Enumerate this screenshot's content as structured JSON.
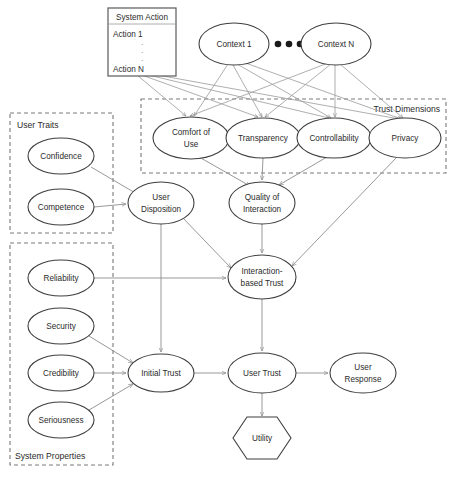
{
  "diagram": {
    "colors": {
      "node_stroke": "#3f3f3f",
      "edge": "#8c8c8c",
      "group_stroke": "#7a7a7a",
      "text": "#2b2b2b",
      "background": "#ffffff"
    },
    "system_action_table": {
      "header": "System Action",
      "rows": [
        "Action 1",
        "Action N"
      ],
      "ellipsis": "·"
    },
    "context_nodes": [
      {
        "id": "context1",
        "label": "Context 1",
        "cx": 234,
        "cy": 44,
        "rx": 35,
        "ry": 21
      },
      {
        "id": "contextN",
        "label": "Context N",
        "cx": 336,
        "cy": 44,
        "rx": 35,
        "ry": 21
      }
    ],
    "context_ellipsis_dots": 3,
    "groups": [
      {
        "id": "trust-dimensions",
        "label": "Trust Dimensions",
        "x": 141,
        "y": 99,
        "w": 305,
        "h": 74,
        "label_anchor": "top-right"
      },
      {
        "id": "user-traits",
        "label": "User Traits",
        "x": 10,
        "y": 113,
        "w": 103,
        "h": 120,
        "label_anchor": "top-left"
      },
      {
        "id": "system-properties",
        "label": "System Properties",
        "x": 10,
        "y": 243,
        "w": 103,
        "h": 222,
        "label_anchor": "bottom-left"
      }
    ],
    "nodes": [
      {
        "id": "comfort",
        "label_lines": [
          "Comfort of",
          "Use"
        ],
        "cx": 191,
        "cy": 138,
        "rx": 38,
        "ry": 21
      },
      {
        "id": "transparency",
        "label_lines": [
          "Transparency"
        ],
        "cx": 263,
        "cy": 138,
        "rx": 37,
        "ry": 20
      },
      {
        "id": "controllability",
        "label_lines": [
          "Controllability"
        ],
        "cx": 334,
        "cy": 138,
        "rx": 37,
        "ry": 20
      },
      {
        "id": "privacy",
        "label_lines": [
          "Privacy"
        ],
        "cx": 405,
        "cy": 138,
        "rx": 36,
        "ry": 20
      },
      {
        "id": "confidence",
        "label_lines": [
          "Confidence"
        ],
        "cx": 61,
        "cy": 156,
        "rx": 33,
        "ry": 18
      },
      {
        "id": "competence",
        "label_lines": [
          "Competence"
        ],
        "cx": 61,
        "cy": 207,
        "rx": 33,
        "ry": 18
      },
      {
        "id": "user-disposition",
        "label_lines": [
          "User",
          "Disposition"
        ],
        "cx": 161,
        "cy": 203,
        "rx": 33,
        "ry": 21
      },
      {
        "id": "quality-of-interaction",
        "label_lines": [
          "Quality of",
          "Interaction"
        ],
        "cx": 262,
        "cy": 203,
        "rx": 33,
        "ry": 21
      },
      {
        "id": "interaction-based-trust",
        "label_lines": [
          "Interaction-",
          "based Trust"
        ],
        "cx": 262,
        "cy": 277,
        "rx": 34,
        "ry": 22
      },
      {
        "id": "reliability",
        "label_lines": [
          "Reliability"
        ],
        "cx": 61,
        "cy": 278,
        "rx": 33,
        "ry": 18
      },
      {
        "id": "security",
        "label_lines": [
          "Security"
        ],
        "cx": 61,
        "cy": 326,
        "rx": 33,
        "ry": 18
      },
      {
        "id": "credibility",
        "label_lines": [
          "Credibility"
        ],
        "cx": 61,
        "cy": 373,
        "rx": 33,
        "ry": 18
      },
      {
        "id": "seriousness",
        "label_lines": [
          "Seriousness"
        ],
        "cx": 61,
        "cy": 420,
        "rx": 33,
        "ry": 18
      },
      {
        "id": "initial-trust",
        "label_lines": [
          "Initial Trust"
        ],
        "cx": 161,
        "cy": 373,
        "rx": 33,
        "ry": 19
      },
      {
        "id": "user-trust",
        "label_lines": [
          "User Trust"
        ],
        "cx": 262,
        "cy": 373,
        "rx": 34,
        "ry": 20
      },
      {
        "id": "user-response",
        "label_lines": [
          "User",
          "Response"
        ],
        "cx": 363,
        "cy": 373,
        "rx": 33,
        "ry": 20
      },
      {
        "id": "utility",
        "label_lines": [
          "Utility"
        ],
        "cx": 262,
        "cy": 438,
        "shape": "hexagon",
        "rx": 29,
        "ry": 21
      }
    ],
    "edges": [
      {
        "from": "system-action",
        "to": "comfort"
      },
      {
        "from": "system-action",
        "to": "transparency"
      },
      {
        "from": "system-action",
        "to": "controllability"
      },
      {
        "from": "system-action",
        "to": "privacy"
      },
      {
        "from": "context1",
        "to": "comfort"
      },
      {
        "from": "context1",
        "to": "transparency"
      },
      {
        "from": "context1",
        "to": "controllability"
      },
      {
        "from": "context1",
        "to": "privacy"
      },
      {
        "from": "contextN",
        "to": "comfort"
      },
      {
        "from": "contextN",
        "to": "transparency"
      },
      {
        "from": "contextN",
        "to": "controllability"
      },
      {
        "from": "contextN",
        "to": "privacy"
      },
      {
        "from": "comfort",
        "to": "quality-of-interaction"
      },
      {
        "from": "transparency",
        "to": "quality-of-interaction"
      },
      {
        "from": "controllability",
        "to": "quality-of-interaction"
      },
      {
        "from": "privacy",
        "to": "interaction-based-trust"
      },
      {
        "from": "confidence",
        "to": "user-disposition"
      },
      {
        "from": "competence",
        "to": "user-disposition"
      },
      {
        "from": "user-disposition",
        "to": "interaction-based-trust"
      },
      {
        "from": "user-disposition",
        "to": "initial-trust"
      },
      {
        "from": "quality-of-interaction",
        "to": "interaction-based-trust"
      },
      {
        "from": "reliability",
        "to": "interaction-based-trust"
      },
      {
        "from": "security",
        "to": "initial-trust"
      },
      {
        "from": "credibility",
        "to": "initial-trust"
      },
      {
        "from": "seriousness",
        "to": "initial-trust"
      },
      {
        "from": "interaction-based-trust",
        "to": "user-trust"
      },
      {
        "from": "initial-trust",
        "to": "user-trust"
      },
      {
        "from": "user-trust",
        "to": "user-response"
      },
      {
        "from": "user-trust",
        "to": "utility"
      }
    ]
  }
}
